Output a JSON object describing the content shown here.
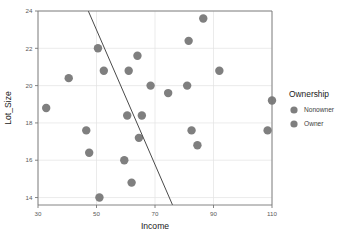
{
  "chart_data": {
    "type": "scatter",
    "title": "",
    "xlabel": "Income",
    "ylabel": "Lot_Size",
    "xlim": [
      30,
      110
    ],
    "ylim": [
      13.6,
      24
    ],
    "xticks": [
      30,
      50,
      70,
      90,
      110
    ],
    "yticks": [
      14,
      16,
      18,
      20,
      22,
      24
    ],
    "grid": true,
    "legend_position": "right",
    "legend_title": "Ownership",
    "legend_entries": [
      {
        "label": "Nonowner",
        "color": "#7f7f7f"
      },
      {
        "label": "Owner",
        "color": "#7f7f7f"
      }
    ],
    "marker_color": "#7f7f7f",
    "marker_size": 4.2,
    "points": [
      {
        "x": 32.8,
        "y": 18.8
      },
      {
        "x": 40.5,
        "y": 20.4
      },
      {
        "x": 46.5,
        "y": 17.6
      },
      {
        "x": 47.5,
        "y": 16.4
      },
      {
        "x": 50.5,
        "y": 22.0
      },
      {
        "x": 51.0,
        "y": 14.0
      },
      {
        "x": 52.5,
        "y": 20.8
      },
      {
        "x": 59.5,
        "y": 16.0
      },
      {
        "x": 60.5,
        "y": 18.4
      },
      {
        "x": 61.0,
        "y": 20.8
      },
      {
        "x": 62.0,
        "y": 14.8
      },
      {
        "x": 64.0,
        "y": 21.6
      },
      {
        "x": 64.5,
        "y": 17.2
      },
      {
        "x": 65.5,
        "y": 18.4
      },
      {
        "x": 68.5,
        "y": 20.0
      },
      {
        "x": 74.5,
        "y": 19.6
      },
      {
        "x": 81.0,
        "y": 20.0
      },
      {
        "x": 81.5,
        "y": 22.4
      },
      {
        "x": 82.5,
        "y": 17.6
      },
      {
        "x": 84.5,
        "y": 16.8
      },
      {
        "x": 86.5,
        "y": 23.6
      },
      {
        "x": 92.0,
        "y": 20.8
      },
      {
        "x": 108.5,
        "y": 17.6
      },
      {
        "x": 110.0,
        "y": 19.2
      }
    ],
    "line": {
      "name": "classification-boundary",
      "x1": 47.2,
      "y1": 24.0,
      "x2": 76.0,
      "y2": 13.6,
      "color": "#4a4a4a"
    }
  },
  "axes": {
    "x_label": "Income",
    "y_label": "Lot_Size"
  }
}
